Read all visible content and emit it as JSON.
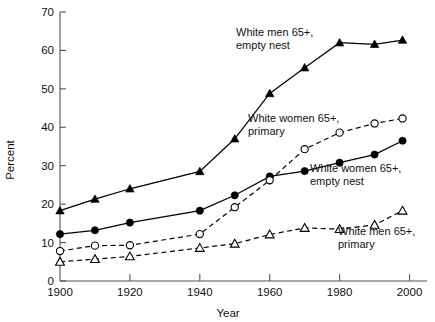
{
  "chart_data": {
    "type": "line",
    "title": "",
    "xlabel": "Year",
    "ylabel": "Percent",
    "xlim": [
      1900,
      2005
    ],
    "ylim": [
      0,
      70
    ],
    "grid": false,
    "legend_position": "inline-annotations",
    "xticks": [
      1900,
      1920,
      1940,
      1960,
      1980,
      2000
    ],
    "xtick_labels": [
      "1900",
      "1920",
      "1940",
      "1960",
      "1980",
      "2000"
    ],
    "yticks": [
      0,
      10,
      20,
      30,
      40,
      50,
      60,
      70
    ],
    "ytick_labels": [
      "0",
      "10",
      "20",
      "30",
      "40",
      "50",
      "60",
      "70"
    ],
    "series": [
      {
        "name": "White men 65+, empty nest",
        "marker": "filled-triangle",
        "line": "solid",
        "x": [
          1900,
          1910,
          1920,
          1940,
          1950,
          1960,
          1970,
          1980,
          1990,
          1998
        ],
        "values": [
          18.3,
          21.3,
          24.0,
          28.5,
          37.0,
          48.8,
          55.5,
          62.0,
          61.6,
          62.7
        ]
      },
      {
        "name": "White women 65+, empty nest",
        "marker": "filled-circle",
        "line": "solid",
        "x": [
          1900,
          1910,
          1920,
          1940,
          1950,
          1960,
          1970,
          1980,
          1990,
          1998
        ],
        "values": [
          12.2,
          13.2,
          15.2,
          18.3,
          22.3,
          27.2,
          28.6,
          30.8,
          32.9,
          36.5
        ]
      },
      {
        "name": "White women 65+, primary",
        "marker": "open-circle",
        "line": "dashed",
        "x": [
          1900,
          1910,
          1920,
          1940,
          1950,
          1960,
          1970,
          1980,
          1990,
          1998
        ],
        "values": [
          7.8,
          9.2,
          9.3,
          12.2,
          19.2,
          26.2,
          34.3,
          38.6,
          41.0,
          42.3
        ]
      },
      {
        "name": "White men 65+, primary",
        "marker": "open-triangle",
        "line": "dashed",
        "x": [
          1900,
          1910,
          1920,
          1940,
          1950,
          1960,
          1970,
          1980,
          1990,
          1998
        ],
        "values": [
          5.0,
          5.7,
          6.4,
          8.6,
          9.7,
          12.1,
          13.8,
          13.5,
          14.6,
          18.3
        ]
      }
    ],
    "annotations": [
      {
        "id": "men-empty-nest",
        "lines": [
          "White men 65+,",
          "empty nest"
        ],
        "x": 236,
        "y": 36
      },
      {
        "id": "women-primary",
        "lines": [
          "White women 65+,",
          "primary"
        ],
        "x": 248,
        "y": 122
      },
      {
        "id": "women-empty-nest",
        "lines": [
          "White women 65+,",
          "empty nest"
        ],
        "x": 310,
        "y": 172
      },
      {
        "id": "men-primary",
        "lines": [
          "White men 65+,",
          "primary"
        ],
        "x": 338,
        "y": 235
      }
    ],
    "colors": {
      "line": "#000000",
      "axis": "#555555",
      "text": "#111111",
      "background": "#ffffff"
    }
  }
}
